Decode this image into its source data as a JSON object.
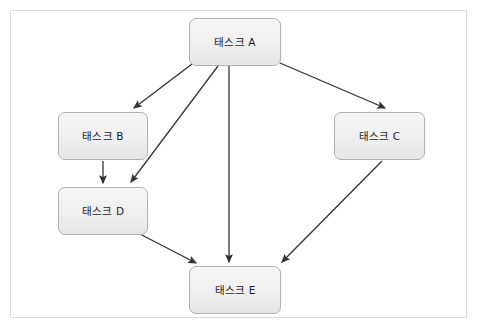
{
  "figure": {
    "kind": "task-dependency-diagram",
    "frame": {
      "border_color": "#dcdcdc",
      "background_color": "#ffffff"
    },
    "caption_fragment": "",
    "style": {
      "node_fill_top": "#f6f6f6",
      "node_fill_bottom": "#e6e6e6",
      "node_border_color": "#b0b0b0",
      "node_text_color": "#1d1d1d",
      "edge_color": "#333333"
    }
  },
  "nodes": [
    {
      "id": "A",
      "label": "태스크 A",
      "x": 189,
      "y": 18,
      "w": 92,
      "h": 48
    },
    {
      "id": "B",
      "label": "태스크 B",
      "x": 58,
      "y": 112,
      "w": 90,
      "h": 48
    },
    {
      "id": "C",
      "label": "태스크 C",
      "x": 334,
      "y": 112,
      "w": 91,
      "h": 48
    },
    {
      "id": "D",
      "label": "태스크 D",
      "x": 58,
      "y": 187,
      "w": 90,
      "h": 48
    },
    {
      "id": "E",
      "label": "태스크 E",
      "x": 189,
      "y": 266,
      "w": 92,
      "h": 48
    }
  ],
  "edges": [
    {
      "id": "a-to-b",
      "from": "A",
      "to": "B",
      "x1": 192,
      "y1": 64,
      "x2": 134,
      "y2": 108
    },
    {
      "id": "a-to-d",
      "from": "A",
      "to": "D",
      "x1": 218,
      "y1": 66,
      "x2": 131,
      "y2": 182
    },
    {
      "id": "a-to-c",
      "from": "A",
      "to": "C",
      "x1": 280,
      "y1": 63,
      "x2": 385,
      "y2": 108
    },
    {
      "id": "a-to-e",
      "from": "A",
      "to": "E",
      "x1": 229,
      "y1": 66,
      "x2": 229,
      "y2": 262
    },
    {
      "id": "b-to-d",
      "from": "B",
      "to": "D",
      "x1": 103,
      "y1": 161,
      "x2": 103,
      "y2": 183
    },
    {
      "id": "d-to-e",
      "from": "D",
      "to": "E",
      "x1": 138,
      "y1": 233,
      "x2": 196,
      "y2": 263
    },
    {
      "id": "c-to-e",
      "from": "C",
      "to": "E",
      "x1": 382,
      "y1": 161,
      "x2": 282,
      "y2": 262
    }
  ]
}
